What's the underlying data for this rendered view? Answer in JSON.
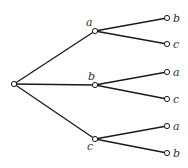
{
  "diagram": {
    "type": "tree",
    "root": {
      "id": "root",
      "x": 14,
      "y": 84,
      "label": ""
    },
    "level1": [
      {
        "id": "a",
        "label": "a",
        "x": 95,
        "y": 31,
        "lx": 86,
        "ly": 26
      },
      {
        "id": "b",
        "label": "b",
        "x": 95,
        "y": 85,
        "lx": 88,
        "ly": 80
      },
      {
        "id": "c",
        "label": "c",
        "x": 95,
        "y": 139,
        "lx": 87,
        "ly": 150
      }
    ],
    "level2": [
      {
        "parent": "a",
        "label": "b",
        "x": 167,
        "y": 18
      },
      {
        "parent": "a",
        "label": "c",
        "x": 167,
        "y": 44
      },
      {
        "parent": "b",
        "label": "a",
        "x": 167,
        "y": 72
      },
      {
        "parent": "b",
        "label": "c",
        "x": 167,
        "y": 99
      },
      {
        "parent": "c",
        "label": "a",
        "x": 167,
        "y": 126
      },
      {
        "parent": "c",
        "label": "b",
        "x": 167,
        "y": 153
      }
    ]
  }
}
